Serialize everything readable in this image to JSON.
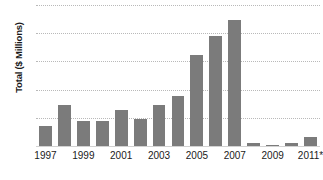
{
  "chart_data": {
    "type": "bar",
    "title": "",
    "xlabel": "",
    "ylabel": "Total ($ Millions)",
    "ylim": [
      0,
      250
    ],
    "ytick_values": [
      250,
      200,
      150,
      100,
      50,
      0
    ],
    "ytick_labels": [
      "250",
      "200",
      "150",
      "100",
      "50",
      "0"
    ],
    "grid": true,
    "legend": null,
    "bar_color": "#7b7b7b",
    "gridline_color": "#b9b9b9",
    "categories": [
      "1997",
      "1998",
      "1999",
      "2000",
      "2001",
      "2002",
      "2003",
      "2004",
      "2005",
      "2006",
      "2007",
      "2008",
      "2009",
      "2010",
      "2011*"
    ],
    "values": [
      35,
      72,
      44,
      44,
      63,
      48,
      73,
      89,
      162,
      195,
      224,
      6,
      1,
      5,
      16
    ],
    "xtick_labels": [
      "1997",
      "1999",
      "2001",
      "2003",
      "2005",
      "2007",
      "2009",
      "2011*"
    ],
    "xtick_categories": [
      "1997",
      "1999",
      "2001",
      "2003",
      "2005",
      "2007",
      "2009",
      "2011*"
    ]
  }
}
